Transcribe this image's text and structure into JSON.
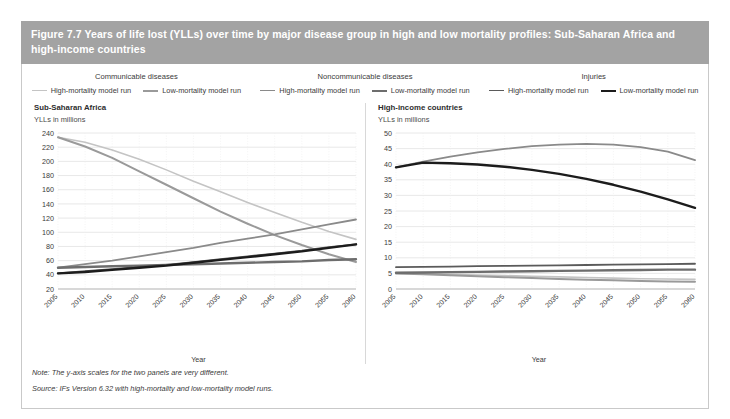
{
  "figure": {
    "title": "Figure 7.7 Years of life lost (YLLs) over time by major disease group in high and low mortality profiles: Sub-Saharan Africa and high-income countries",
    "note": "Note: The y-axis scales for the two panels are very different.",
    "source": "Source: IFs Version 6.32 with high-mortality and low-mortality model runs."
  },
  "colors": {
    "title_bar": "#a3a3a3",
    "title_text": "#ffffff",
    "communicable_high": "#c4c4c4",
    "communicable_low": "#9a9a9a",
    "noncommunicable_high": "#8a8a8a",
    "noncommunicable_low": "#6d6d6d",
    "injuries_high": "#5a5a5a",
    "injuries_low": "#1c1c1c",
    "grid": "#e2e2e2",
    "axis": "#bdbdbd",
    "text": "#3a3a3a"
  },
  "legend": {
    "groups": [
      {
        "title": "Communicable diseases",
        "items": [
          {
            "label": "High-mortality model run",
            "color": "#c4c4c4",
            "width": 1.6
          },
          {
            "label": "Low-mortality model run",
            "color": "#9a9a9a",
            "width": 2.0
          }
        ]
      },
      {
        "title": "Noncommunicable diseases",
        "items": [
          {
            "label": "High-mortality model run",
            "color": "#8a8a8a",
            "width": 1.8
          },
          {
            "label": "Low-mortality model run",
            "color": "#6d6d6d",
            "width": 2.4
          }
        ]
      },
      {
        "title": "Injuries",
        "items": [
          {
            "label": "High-mortality model run",
            "color": "#5a5a5a",
            "width": 1.8
          },
          {
            "label": "Low-mortality model run",
            "color": "#1c1c1c",
            "width": 2.4
          }
        ]
      }
    ]
  },
  "chart_data": [
    {
      "type": "line",
      "title": "Sub-Saharan Africa",
      "ylabel": "YLLs in millions",
      "xlabel": "Year",
      "grid": true,
      "legend_position": "top-shared",
      "x": [
        2005,
        2010,
        2015,
        2020,
        2025,
        2030,
        2035,
        2040,
        2045,
        2050,
        2055,
        2060
      ],
      "xlim": [
        2005,
        2060
      ],
      "ylim": [
        20,
        240
      ],
      "yticks": [
        20,
        40,
        60,
        80,
        100,
        120,
        140,
        160,
        180,
        200,
        220,
        240
      ],
      "xticks": [
        "2005",
        "2010",
        "2015",
        "2020",
        "2025",
        "2030",
        "2035",
        "2040",
        "2045",
        "2050",
        "2055",
        "2060"
      ],
      "series": [
        {
          "name": "Communicable diseases - High-mortality model run",
          "color": "#c4c4c4",
          "width": 1.6,
          "values": [
            234,
            227,
            216,
            203,
            188,
            172,
            157,
            142,
            128,
            114,
            101,
            90
          ]
        },
        {
          "name": "Communicable diseases - Low-mortality model run",
          "color": "#9a9a9a",
          "width": 2.0,
          "values": [
            234,
            221,
            205,
            186,
            167,
            148,
            129,
            112,
            96,
            82,
            69,
            58
          ]
        },
        {
          "name": "Noncommunicable diseases - High-mortality model run",
          "color": "#8a8a8a",
          "width": 1.8,
          "values": [
            50,
            55,
            60,
            66,
            72,
            78,
            85,
            91,
            97,
            104,
            111,
            118
          ]
        },
        {
          "name": "Noncommunicable diseases - Low-mortality model run",
          "color": "#6d6d6d",
          "width": 2.4,
          "values": [
            50,
            51,
            52,
            53,
            54,
            55,
            56,
            57,
            58,
            59,
            61,
            62
          ]
        },
        {
          "name": "Injuries - High-mortality model run",
          "color": "#5a5a5a",
          "width": 1.8,
          "values": [
            42,
            45,
            48,
            51,
            54,
            58,
            62,
            66,
            70,
            74,
            79,
            83
          ]
        },
        {
          "name": "Injuries - Low-mortality model run",
          "color": "#1c1c1c",
          "width": 2.4,
          "values": [
            42,
            44,
            47,
            50,
            53,
            57,
            61,
            65,
            69,
            73,
            78,
            83
          ]
        }
      ]
    },
    {
      "type": "line",
      "title": "High-income countries",
      "ylabel": "YLLs in millions",
      "xlabel": "Year",
      "grid": true,
      "legend_position": "top-shared",
      "x": [
        2005,
        2010,
        2015,
        2020,
        2025,
        2030,
        2035,
        2040,
        2045,
        2050,
        2055,
        2060
      ],
      "xlim": [
        2005,
        2060
      ],
      "ylim": [
        0,
        50
      ],
      "yticks": [
        0,
        5,
        10,
        15,
        20,
        25,
        30,
        35,
        40,
        45,
        50
      ],
      "xticks": [
        "2005",
        "2010",
        "2015",
        "2020",
        "2025",
        "2030",
        "2035",
        "2040",
        "2045",
        "2050",
        "2055",
        "2060"
      ],
      "series": [
        {
          "name": "Communicable diseases - High-mortality model run",
          "color": "#c4c4c4",
          "width": 1.6,
          "values": [
            5.0,
            4.9,
            4.7,
            4.5,
            4.3,
            4.1,
            3.9,
            3.7,
            3.5,
            3.3,
            3.2,
            3.1
          ]
        },
        {
          "name": "Communicable diseases - Low-mortality model run",
          "color": "#9a9a9a",
          "width": 2.0,
          "values": [
            5.0,
            4.7,
            4.4,
            4.1,
            3.8,
            3.5,
            3.2,
            3.0,
            2.8,
            2.6,
            2.4,
            2.3
          ]
        },
        {
          "name": "Noncommunicable diseases - High-mortality model run",
          "color": "#8a8a8a",
          "width": 1.8,
          "values": [
            39.0,
            40.8,
            42.4,
            43.8,
            44.9,
            45.8,
            46.3,
            46.5,
            46.3,
            45.5,
            44.0,
            41.3
          ]
        },
        {
          "name": "Noncommunicable diseases - Low-mortality model run",
          "color": "#6d6d6d",
          "width": 2.4,
          "values": [
            5.2,
            5.3,
            5.4,
            5.5,
            5.6,
            5.7,
            5.8,
            5.9,
            6.0,
            6.1,
            6.2,
            6.2
          ]
        },
        {
          "name": "Injuries - High-mortality model run",
          "color": "#5a5a5a",
          "width": 1.8,
          "values": [
            7.0,
            7.1,
            7.2,
            7.3,
            7.4,
            7.5,
            7.6,
            7.7,
            7.8,
            7.9,
            8.0,
            8.1
          ]
        },
        {
          "name": "Injuries - Low-mortality model run",
          "color": "#1c1c1c",
          "width": 2.4,
          "values": [
            39.0,
            40.5,
            40.3,
            39.9,
            39.2,
            38.2,
            36.9,
            35.3,
            33.4,
            31.2,
            28.7,
            26.0
          ]
        }
      ]
    }
  ]
}
